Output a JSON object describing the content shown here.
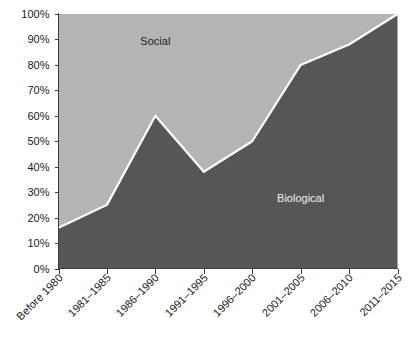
{
  "chart_data": {
    "type": "area",
    "title": "",
    "subtitle": "",
    "xlabel": "",
    "ylabel": "",
    "stacked": true,
    "stack_mode": "percent",
    "grid": false,
    "legend_position": "inline-annotations",
    "ylim": [
      0,
      100
    ],
    "ytick_labels": [
      "0%",
      "10%",
      "20%",
      "30%",
      "40%",
      "50%",
      "60%",
      "70%",
      "80%",
      "90%",
      "100%"
    ],
    "ytick_values": [
      0,
      10,
      20,
      30,
      40,
      50,
      60,
      70,
      80,
      90,
      100
    ],
    "categories": [
      "Before 1980",
      "1981–1985",
      "1986–1990",
      "1991–1995",
      "1996–2000",
      "2001–2005",
      "2006–2010",
      "2011–2015"
    ],
    "series": [
      {
        "name": "Biological",
        "color": "#565656",
        "label_color": "#f2f2f2",
        "values": [
          16,
          25,
          60,
          38,
          50,
          80,
          88,
          100
        ]
      },
      {
        "name": "Social",
        "color": "#b4b4b4",
        "label_color": "#1f1f1f",
        "values": [
          84,
          75,
          40,
          62,
          50,
          20,
          12,
          0
        ]
      }
    ],
    "annotations": [
      {
        "text": "Social",
        "x_category": "1986–1990",
        "y_percent": 88
      },
      {
        "text": "Biological",
        "x_category": "2001–2005",
        "y_percent": 26
      }
    ],
    "divider_color": "#fdfdfd",
    "axis_color": "#3c3c3c",
    "background": "#ffffff"
  },
  "axis": {
    "y_label_suffix": "%",
    "x_label_rotation": "-45"
  }
}
